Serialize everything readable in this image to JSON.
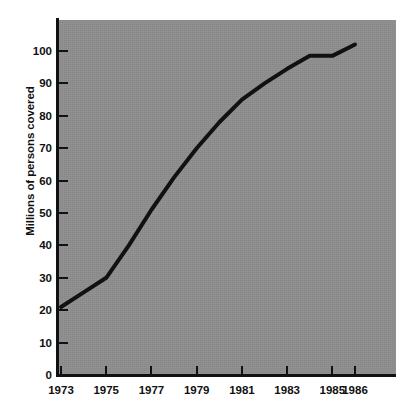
{
  "chart_data": {
    "type": "line",
    "title": "",
    "subtitle": "",
    "xlabel": "",
    "ylabel": "Millions of persons covered",
    "xlim": [
      1973,
      1986.8
    ],
    "ylim": [
      0,
      108
    ],
    "grid": false,
    "legend": null,
    "background_color": "#8e8e8e",
    "line_color": "#111111",
    "line_width_px": 4,
    "x_tick_labels": [
      "1973",
      "1975",
      "1977",
      "1979",
      "1981",
      "1983",
      "1985",
      "1986"
    ],
    "x_tick_values": [
      1973,
      1975,
      1977,
      1979,
      1981,
      1983,
      1985,
      1986
    ],
    "y_tick_labels": [
      "0",
      "10",
      "20",
      "30",
      "40",
      "50",
      "60",
      "70",
      "80",
      "90",
      "100"
    ],
    "y_tick_values": [
      0,
      10,
      20,
      30,
      40,
      50,
      60,
      70,
      80,
      90,
      100
    ],
    "series": [
      {
        "name": "Persons covered",
        "x": [
          1973,
          1974,
          1975,
          1976,
          1977,
          1978,
          1979,
          1980,
          1981,
          1982,
          1983,
          1984,
          1985,
          1986
        ],
        "values": [
          21,
          25.5,
          30,
          40,
          51,
          61,
          70,
          78,
          85,
          90,
          94.5,
          98.5,
          98.5,
          102
        ]
      }
    ]
  }
}
